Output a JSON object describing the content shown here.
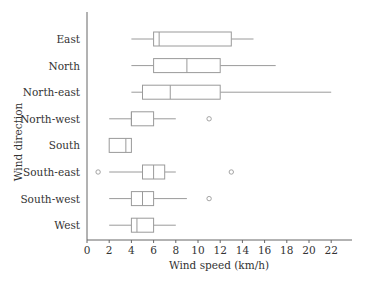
{
  "chart_data": {
    "type": "boxplot",
    "orientation": "horizontal",
    "title": "",
    "xlabel": "Wind speed (km/h)",
    "ylabel": "Wind direction",
    "xlim": [
      0,
      24
    ],
    "xticks": [
      0,
      2,
      4,
      6,
      8,
      10,
      12,
      14,
      16,
      18,
      20,
      22
    ],
    "grid": false,
    "legend": null,
    "categories": [
      "East",
      "North",
      "North-east",
      "North-west",
      "South",
      "South-east",
      "South-west",
      "West"
    ],
    "series": [
      {
        "name": "East",
        "whisker_low": 4,
        "q1": 6,
        "median": 6.5,
        "q3": 13,
        "whisker_high": 15,
        "outliers": []
      },
      {
        "name": "North",
        "whisker_low": 4,
        "q1": 6,
        "median": 9,
        "q3": 12,
        "whisker_high": 17,
        "outliers": []
      },
      {
        "name": "North-east",
        "whisker_low": 4,
        "q1": 5,
        "median": 7.5,
        "q3": 12,
        "whisker_high": 22,
        "outliers": []
      },
      {
        "name": "North-west",
        "whisker_low": 2,
        "q1": 4,
        "median": 4,
        "q3": 6,
        "whisker_high": 8,
        "outliers": [
          11
        ]
      },
      {
        "name": "South",
        "whisker_low": 2,
        "q1": 2,
        "median": 3.5,
        "q3": 4,
        "whisker_high": 4,
        "outliers": []
      },
      {
        "name": "South-east",
        "whisker_low": 2,
        "q1": 5,
        "median": 6,
        "q3": 7,
        "whisker_high": 8,
        "outliers": [
          1,
          13
        ]
      },
      {
        "name": "South-west",
        "whisker_low": 2,
        "q1": 4,
        "median": 5,
        "q3": 6,
        "whisker_high": 9,
        "outliers": [
          11
        ]
      },
      {
        "name": "West",
        "whisker_low": 2,
        "q1": 4,
        "median": 4.5,
        "q3": 6,
        "whisker_high": 8,
        "outliers": []
      }
    ],
    "colors": {
      "box_stroke": "#9a9a9a",
      "axis": "#666666",
      "text": "#333333",
      "background": "#ffffff"
    }
  }
}
